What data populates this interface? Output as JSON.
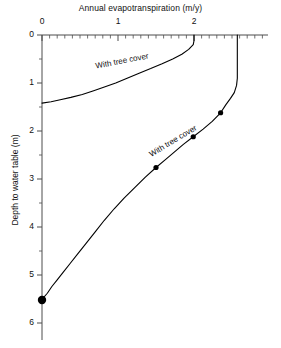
{
  "chart_data": {
    "type": "line",
    "title": "Annual evapotranspiration (m/y)",
    "xlabel": "Annual evapotranspiration (m/y)",
    "ylabel": "Depth to water table (m)",
    "xlim": [
      0,
      2.9
    ],
    "ylim": [
      0,
      6.3
    ],
    "y_inverted": true,
    "grid": false,
    "legend": "inline-curve-labels",
    "xticks": [
      0,
      1,
      2
    ],
    "xtick_labels": [
      "0",
      "1",
      "2"
    ],
    "x_minor_tick_step": 0.1,
    "yticks": [
      0,
      1,
      2,
      3,
      4,
      5,
      6
    ],
    "ytick_labels": [
      "0",
      "1",
      "2",
      "3",
      "4",
      "5",
      "6"
    ],
    "y_minor_tick_step": 0.5,
    "series": [
      {
        "name": "With tree cover",
        "label": "With tree cover",
        "note": "upper curve: shallow water table, evapotranspiration rises to ~2.0 m/y then caps vertically at the surface",
        "points": [
          {
            "x": 2.0,
            "y": 0.0
          },
          {
            "x": 2.0,
            "y": 0.12
          },
          {
            "x": 1.99,
            "y": 0.2
          },
          {
            "x": 1.93,
            "y": 0.3
          },
          {
            "x": 1.84,
            "y": 0.4
          },
          {
            "x": 1.72,
            "y": 0.5
          },
          {
            "x": 1.58,
            "y": 0.6
          },
          {
            "x": 1.43,
            "y": 0.7
          },
          {
            "x": 1.27,
            "y": 0.8
          },
          {
            "x": 1.12,
            "y": 0.9
          },
          {
            "x": 0.97,
            "y": 1.0
          },
          {
            "x": 0.83,
            "y": 1.08
          },
          {
            "x": 0.68,
            "y": 1.16
          },
          {
            "x": 0.53,
            "y": 1.24
          },
          {
            "x": 0.38,
            "y": 1.3
          },
          {
            "x": 0.24,
            "y": 1.35
          },
          {
            "x": 0.12,
            "y": 1.39
          },
          {
            "x": 0.0,
            "y": 1.42
          }
        ],
        "markers": []
      },
      {
        "name": "With tree cover (deep)",
        "label": "With tree cover",
        "note": "lower curve: evapotranspiration declines with increasing depth to water table, vertical cap at ~2.57 m/y",
        "points": [
          {
            "x": 2.57,
            "y": 0.0
          },
          {
            "x": 2.57,
            "y": 0.9
          },
          {
            "x": 2.56,
            "y": 1.05
          },
          {
            "x": 2.53,
            "y": 1.2
          },
          {
            "x": 2.48,
            "y": 1.32
          },
          {
            "x": 2.42,
            "y": 1.45
          },
          {
            "x": 2.35,
            "y": 1.62
          },
          {
            "x": 2.24,
            "y": 1.8
          },
          {
            "x": 2.12,
            "y": 1.96
          },
          {
            "x": 1.99,
            "y": 2.12
          },
          {
            "x": 1.86,
            "y": 2.28
          },
          {
            "x": 1.74,
            "y": 2.44
          },
          {
            "x": 1.62,
            "y": 2.6
          },
          {
            "x": 1.5,
            "y": 2.76
          },
          {
            "x": 1.36,
            "y": 2.96
          },
          {
            "x": 1.22,
            "y": 3.18
          },
          {
            "x": 1.08,
            "y": 3.4
          },
          {
            "x": 0.95,
            "y": 3.62
          },
          {
            "x": 0.82,
            "y": 3.86
          },
          {
            "x": 0.7,
            "y": 4.1
          },
          {
            "x": 0.58,
            "y": 4.34
          },
          {
            "x": 0.47,
            "y": 4.56
          },
          {
            "x": 0.37,
            "y": 4.76
          },
          {
            "x": 0.28,
            "y": 4.94
          },
          {
            "x": 0.2,
            "y": 5.1
          },
          {
            "x": 0.13,
            "y": 5.24
          },
          {
            "x": 0.07,
            "y": 5.38
          },
          {
            "x": 0.02,
            "y": 5.47
          },
          {
            "x": 0.0,
            "y": 5.52
          }
        ],
        "markers": [
          {
            "x": 2.35,
            "y": 1.62,
            "size": "small"
          },
          {
            "x": 1.99,
            "y": 2.12,
            "size": "small"
          },
          {
            "x": 1.5,
            "y": 2.76,
            "size": "small"
          },
          {
            "x": 0.0,
            "y": 5.52,
            "size": "large"
          }
        ]
      }
    ],
    "annotations": [
      {
        "text": "With tree cover",
        "x": 1.05,
        "y": 0.55,
        "rotation": -11,
        "target": "upper-curve"
      },
      {
        "text": "With tree cover",
        "x": 1.72,
        "y": 2.2,
        "rotation": -31,
        "target": "lower-curve"
      }
    ],
    "colors": {
      "curve": "#000000",
      "axis": "#4d4d4d",
      "text": "#111111",
      "background": "#ffffff"
    }
  }
}
